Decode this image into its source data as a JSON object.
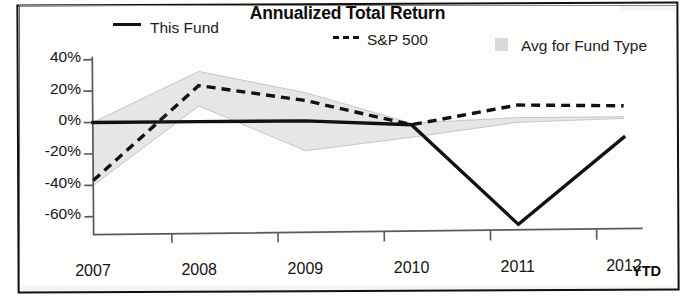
{
  "chart_data": {
    "type": "line",
    "title": "Annualized Total Return",
    "xlabel": "",
    "ylabel": "",
    "categories": [
      "2007",
      "2008",
      "2009",
      "2010",
      "2011",
      "2012"
    ],
    "x_axis_suffix_label": "YTD",
    "ylim": [
      -60,
      40
    ],
    "yticks": [
      40,
      20,
      0,
      -20,
      -40,
      -60
    ],
    "ytick_labels": [
      "40%",
      "20%",
      "0%",
      "-20%",
      "-40%",
      "-60%"
    ],
    "grid": false,
    "legend_position": "top",
    "series": [
      {
        "name": "This Fund",
        "style": "solid",
        "color": "#111111",
        "values": [
          0,
          0,
          0,
          -3,
          -67,
          -12
        ]
      },
      {
        "name": "S&P 500",
        "style": "dashed",
        "color": "#111111",
        "values": [
          -37,
          23,
          13,
          -3,
          9,
          8
        ]
      },
      {
        "name": "Avg for Fund Type",
        "style": "band",
        "color": "#d9d9d9",
        "upper": [
          0,
          32,
          18,
          -2,
          1,
          1
        ],
        "lower": [
          -40,
          10,
          -19,
          -11,
          -2,
          0
        ]
      }
    ]
  },
  "legend": {
    "items": [
      {
        "label": "This Fund",
        "swatch": "solid-line-swatch"
      },
      {
        "label": "S&P 500",
        "swatch": "dashed-line-swatch"
      },
      {
        "label": "Avg for Fund Type",
        "swatch": "gray-band-swatch"
      }
    ]
  }
}
